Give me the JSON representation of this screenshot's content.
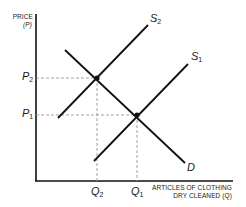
{
  "diagram": {
    "y_axis": {
      "title_line1": "PRICE",
      "title_line2": "(P)"
    },
    "x_axis": {
      "title_line1": "ARTICLES OF CLOTHING",
      "title_line2": "DRY CLEANED (Q)"
    },
    "price_ticks": [
      {
        "symbol": "P",
        "sub": "2"
      },
      {
        "symbol": "P",
        "sub": "1"
      }
    ],
    "quantity_ticks": [
      {
        "symbol": "Q",
        "sub": "2"
      },
      {
        "symbol": "Q",
        "sub": "1"
      }
    ],
    "curves": {
      "s2": {
        "symbol": "S",
        "sub": "2"
      },
      "s1": {
        "symbol": "S",
        "sub": "1"
      },
      "d": {
        "symbol": "D"
      }
    },
    "colors": {
      "line": "#111111",
      "guide": "#999999"
    }
  }
}
